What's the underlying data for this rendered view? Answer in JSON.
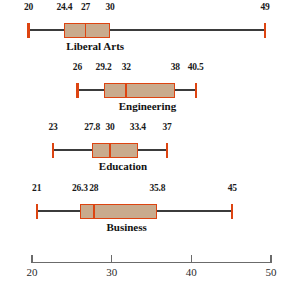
{
  "chart_data": {
    "type": "box",
    "title": "",
    "xlabel": "",
    "ylabel": "",
    "orientation": "horizontal",
    "xlim": [
      20,
      50
    ],
    "grid": false,
    "legend": null,
    "axis": {
      "ticks": [
        20,
        30,
        40,
        50
      ],
      "tick_labels": [
        "20",
        "30",
        "40",
        "50"
      ]
    },
    "colors": {
      "box_fill": "#c9ab8d",
      "box_edge": "#dd4411",
      "whisker": "#3b3b3b",
      "cap": "#dd4411",
      "median": "#dd4411",
      "axis": "#6b6b6b",
      "text": "#111111"
    },
    "categories": [
      "Liberal Arts",
      "Engineering",
      "Education",
      "Business"
    ],
    "boxes": [
      {
        "label": "Liberal Arts",
        "min": 20,
        "q1": 24.4,
        "median": 27,
        "q3": 30,
        "max": 49,
        "labels": [
          "20",
          "24.4",
          "27",
          "30",
          "49"
        ]
      },
      {
        "label": "Engineering",
        "min": 26,
        "q1": 29.2,
        "median": 32,
        "q3": 38,
        "max": 40.5,
        "labels": [
          "26",
          "29.2",
          "32",
          "38",
          "40.5"
        ]
      },
      {
        "label": "Education",
        "min": 23,
        "q1": 27.8,
        "median": 30,
        "q3": 33.4,
        "max": 37,
        "labels": [
          "23",
          "27.8",
          "30",
          "33.4",
          "37"
        ]
      },
      {
        "label": "Business",
        "min": 21,
        "q1": 26.3,
        "median": 28,
        "q3": 35.8,
        "max": 45,
        "labels": [
          "21",
          "26.3",
          "28",
          "35.8",
          "45"
        ]
      }
    ]
  }
}
